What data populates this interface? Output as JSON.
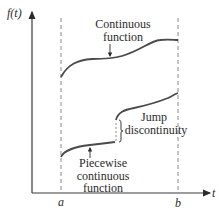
{
  "diagram": {
    "y_axis_label": "f(t)",
    "x_axis_label": "t",
    "markers": {
      "a": "a",
      "b": "b"
    },
    "continuous_label": [
      "Continuous",
      "function"
    ],
    "jump_label": [
      "Jump",
      "discontinuity"
    ],
    "piecewise_label": [
      "Piecewise",
      "continuous",
      "function"
    ]
  },
  "colors": {
    "curve": "#4a4a4a",
    "axis": "#3a3a3a",
    "dashed": "#8a8a8a",
    "text": "#2b2b2b"
  }
}
